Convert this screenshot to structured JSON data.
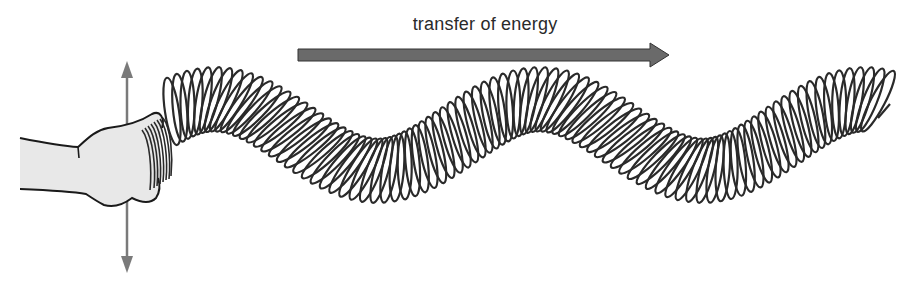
{
  "diagram": {
    "energy_arrow": {
      "label": "transfer of energy",
      "direction": "right",
      "color": "#6a6a6a"
    },
    "motion_arrow": {
      "direction": "up-and-down",
      "color": "#7a7a7a"
    },
    "hand": {
      "fill": "#e8e8e8",
      "outline": "#1a1a1a"
    },
    "spring": {
      "stroke": "#2a2a2a",
      "coil_count": 92,
      "wave_crests": 3,
      "wave_troughs": 2
    }
  }
}
